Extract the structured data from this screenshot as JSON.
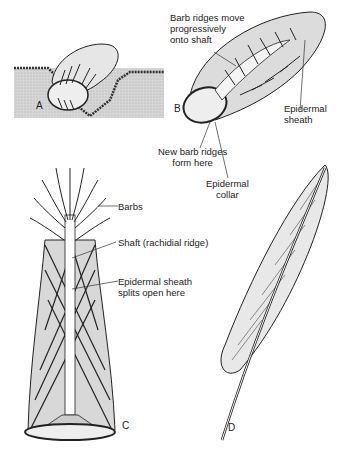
{
  "figure": {
    "panels": [
      {
        "id": "A",
        "label": "A"
      },
      {
        "id": "B",
        "label": "B"
      },
      {
        "id": "C",
        "label": "C"
      },
      {
        "id": "D",
        "label": "D"
      }
    ],
    "labels": {
      "barb_ridges_move_1": "Barb ridges move",
      "barb_ridges_move_2": "progressively",
      "barb_ridges_move_3": "onto shaft",
      "epidermal_sheath_1": "Epidermal",
      "epidermal_sheath_2": "sheath",
      "new_barb_ridges_1": "New barb ridges",
      "new_barb_ridges_2": "form here",
      "epidermal_collar_1": "Epidermal",
      "epidermal_collar_2": "collar",
      "barbs": "Barbs",
      "shaft": "Shaft (rachidial ridge)",
      "sheath_splits_1": "Epidermal sheath",
      "sheath_splits_2": "splits open here"
    },
    "colors": {
      "ink": "#222222",
      "fill_gray": "#d8d8d8",
      "skin_gray": "#cfcfcf"
    }
  }
}
